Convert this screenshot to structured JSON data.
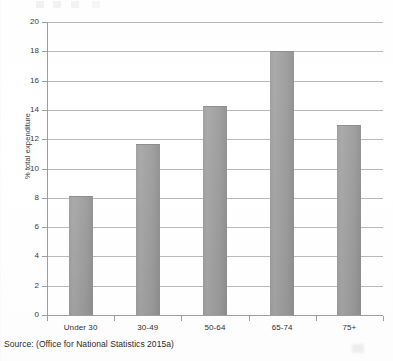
{
  "chart_data": {
    "type": "bar",
    "title": "",
    "subtitle": "",
    "xlabel": "",
    "ylabel": "% total expenditure",
    "categories": [
      "Under 30",
      "30-49",
      "50-64",
      "65-74",
      "75+"
    ],
    "values": [
      8.1,
      11.7,
      14.3,
      18.0,
      13.0
    ],
    "series": [
      {
        "name": "% total expenditure",
        "values": [
          8.1,
          11.7,
          14.3,
          18.0,
          13.0
        ]
      }
    ],
    "ylim": [
      0,
      20
    ],
    "ytick_labels": [
      "0",
      "2",
      "4",
      "6",
      "8",
      "10",
      "12",
      "14",
      "16",
      "18",
      "20"
    ],
    "ytick_values": [
      0,
      2,
      4,
      6,
      8,
      10,
      12,
      14,
      16,
      18,
      20
    ],
    "grid": true,
    "grid_axis": "y",
    "legend": false,
    "legend_position": "none",
    "bar_color": "#9d9d9d",
    "gridline_color": "#b9b9b9",
    "axis_color": "#9e9e9e",
    "background_color": "#ffffff"
  },
  "caption": {
    "source_text": "Source: (Office for National Statistics 2015a)"
  }
}
